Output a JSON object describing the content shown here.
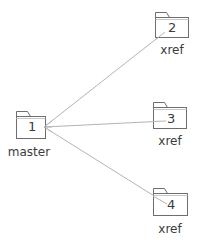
{
  "diagram": {
    "title": "",
    "line_color": "#b4b4b4",
    "stroke_color": "#6e6e6e",
    "text_color": "#3c3c3c",
    "nodes": [
      {
        "id": "1",
        "number": "1",
        "label": "master",
        "icon": "folder-icon"
      },
      {
        "id": "2",
        "number": "2",
        "label": "xref",
        "icon": "folder-icon"
      },
      {
        "id": "3",
        "number": "3",
        "label": "xref",
        "icon": "folder-icon"
      },
      {
        "id": "4",
        "number": "4",
        "label": "xref",
        "icon": "folder-icon"
      }
    ],
    "edges": [
      {
        "from": "1",
        "to": "2"
      },
      {
        "from": "1",
        "to": "3"
      },
      {
        "from": "1",
        "to": "4"
      }
    ]
  }
}
